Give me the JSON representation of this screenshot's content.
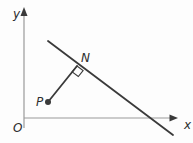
{
  "figure": {
    "background": "#fdfdfd",
    "axis_color": "#9a9a9a",
    "ink_color": "#3a3a3a",
    "label_color": "#2e2e2e",
    "labels": {
      "origin": "O",
      "x_axis": "x",
      "y_axis": "y",
      "point_p": "P",
      "point_n": "N"
    },
    "geometry": {
      "y_axis": {
        "x1": 24,
        "y1": 128,
        "x2": 24,
        "y2": 14
      },
      "y_arrow_points": "24,7 20.5,16 27.5,16",
      "x_axis": {
        "x1": 24,
        "y1": 118,
        "x2": 170,
        "y2": 118
      },
      "x_arrow_points": "178,118 169.5,114.5 169.5,121.5",
      "main_line": {
        "x1": 48,
        "y1": 41,
        "x2": 173,
        "y2": 135
      },
      "segment_pn": {
        "x1": 48,
        "y1": 102,
        "x2": 77,
        "y2": 66
      },
      "point_p_dot": {
        "cx": 48,
        "cy": 102,
        "r": 3
      },
      "right_angle_points": "77,66 83.1,70.6 78.3,76.5 72.2,71.9",
      "label_pos": {
        "origin": {
          "x": 13,
          "y": 132
        },
        "x_axis": {
          "x": 184,
          "y": 129
        },
        "y_axis": {
          "x": 13,
          "y": 18
        },
        "point_p": {
          "x": 36,
          "y": 106
        },
        "point_n": {
          "x": 81,
          "y": 62
        }
      }
    }
  }
}
